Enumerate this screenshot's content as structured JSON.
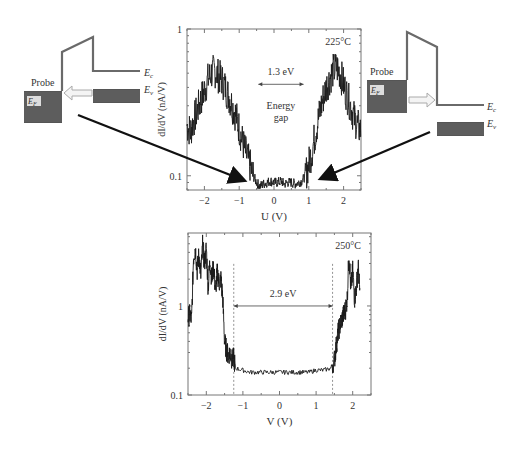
{
  "chart_data": [
    {
      "type": "line",
      "title": "",
      "annotation_temp": "225°C",
      "xlabel": "U (V)",
      "ylabel": "dI/dV (nA/V)",
      "yscale": "log",
      "xlim": [
        -2.5,
        2.5
      ],
      "ylim": [
        0.08,
        1
      ],
      "xticks": [
        -2,
        -1,
        0,
        1,
        2
      ],
      "xtick_labels": [
        "−2",
        "−1",
        "0",
        "1",
        "2"
      ],
      "yticks": [
        0.1,
        1
      ],
      "ytick_labels": [
        "0.1",
        "1"
      ],
      "gap_label": "1.3 eV",
      "gap_range": [
        -0.45,
        0.85
      ],
      "gap_arrow_y": 0.42,
      "center_label": [
        "Energy",
        "gap"
      ],
      "series": [
        {
          "name": "dI/dV 225°C",
          "x": [
            -2.5,
            -2.4,
            -2.3,
            -2.2,
            -2.1,
            -2.0,
            -1.9,
            -1.8,
            -1.7,
            -1.6,
            -1.5,
            -1.4,
            -1.3,
            -1.2,
            -1.1,
            -1.0,
            -0.9,
            -0.8,
            -0.7,
            -0.6,
            -0.5,
            -0.4,
            -0.3,
            -0.2,
            -0.1,
            0.0,
            0.1,
            0.2,
            0.3,
            0.4,
            0.5,
            0.6,
            0.7,
            0.8,
            0.9,
            1.0,
            1.1,
            1.2,
            1.3,
            1.4,
            1.5,
            1.6,
            1.7,
            1.8,
            1.9,
            2.0,
            2.1,
            2.2,
            2.3,
            2.4,
            2.5
          ],
          "y": [
            0.22,
            0.2,
            0.24,
            0.28,
            0.33,
            0.38,
            0.45,
            0.5,
            0.52,
            0.48,
            0.45,
            0.4,
            0.35,
            0.3,
            0.26,
            0.21,
            0.17,
            0.14,
            0.12,
            0.1,
            0.09,
            0.085,
            0.088,
            0.09,
            0.092,
            0.09,
            0.09,
            0.092,
            0.088,
            0.09,
            0.09,
            0.088,
            0.09,
            0.092,
            0.1,
            0.12,
            0.15,
            0.2,
            0.26,
            0.33,
            0.4,
            0.46,
            0.52,
            0.55,
            0.5,
            0.42,
            0.35,
            0.3,
            0.25,
            0.22,
            0.2
          ]
        }
      ]
    },
    {
      "type": "line",
      "title": "",
      "annotation_temp": "250°C",
      "xlabel": "V (V)",
      "ylabel": "dI/dV (nA/V)",
      "yscale": "log",
      "xlim": [
        -2.5,
        2.5
      ],
      "ylim": [
        0.1,
        6.6
      ],
      "xticks": [
        -2,
        -1,
        0,
        1,
        2
      ],
      "xtick_labels": [
        "−2",
        "−1",
        "0",
        "1",
        "2"
      ],
      "yticks": [
        0.1,
        1
      ],
      "ytick_labels": [
        "0.1",
        "1"
      ],
      "gap_label": "2.9 eV",
      "gap_range": [
        -1.25,
        1.45
      ],
      "gap_arrow_y": 1.0,
      "dashed_lines_x": [
        -1.25,
        1.45
      ],
      "series": [
        {
          "name": "dI/dV 250°C",
          "x": [
            -2.5,
            -2.45,
            -2.4,
            -2.35,
            -2.3,
            -2.25,
            -2.2,
            -2.15,
            -2.1,
            -2.05,
            -2.0,
            -1.95,
            -1.9,
            -1.85,
            -1.8,
            -1.75,
            -1.7,
            -1.65,
            -1.6,
            -1.55,
            -1.5,
            -1.45,
            -1.4,
            -1.35,
            -1.3,
            -1.25,
            -1.2,
            -1.0,
            -0.8,
            -0.6,
            -0.4,
            -0.2,
            0.0,
            0.2,
            0.4,
            0.6,
            0.8,
            1.0,
            1.2,
            1.4,
            1.5,
            1.55,
            1.6,
            1.65,
            1.7,
            1.75,
            1.8,
            1.85,
            1.9,
            1.95,
            2.0,
            2.05,
            2.1,
            2.15,
            2.2
          ],
          "y": [
            0.75,
            0.8,
            0.7,
            3.5,
            4.5,
            2.5,
            3.8,
            2.2,
            4.8,
            3.0,
            4.5,
            1.6,
            3.2,
            2.0,
            2.8,
            1.5,
            2.4,
            1.8,
            2.0,
            1.2,
            0.4,
            0.32,
            0.28,
            0.3,
            0.25,
            0.26,
            0.2,
            0.19,
            0.18,
            0.18,
            0.18,
            0.18,
            0.18,
            0.18,
            0.18,
            0.18,
            0.18,
            0.19,
            0.19,
            0.2,
            0.25,
            0.35,
            0.5,
            0.6,
            0.7,
            0.8,
            0.9,
            1.2,
            4.0,
            1.5,
            2.5,
            1.2,
            1.6,
            2.8,
            1.3
          ]
        }
      ]
    }
  ],
  "diagrams": {
    "left": {
      "probe_label": "Probe",
      "fermi_label": "E",
      "fermi_sub": "F",
      "ec_label": "E",
      "ec_sub": "c",
      "ev_label": "E",
      "ev_sub": "v",
      "arrow_direction": "left"
    },
    "right": {
      "probe_label": "Probe",
      "fermi_label": "E",
      "fermi_sub": "F",
      "ec_label": "E",
      "ec_sub": "c",
      "ev_label": "E",
      "ev_sub": "v",
      "arrow_direction": "right"
    }
  },
  "colors": {
    "line": "#1a1a1a",
    "frame": "#777777",
    "band_fill": "#555555",
    "band_line": "#6a6a6a",
    "arrow": "#111111",
    "hollow_arrow": "#bbbbbb"
  }
}
